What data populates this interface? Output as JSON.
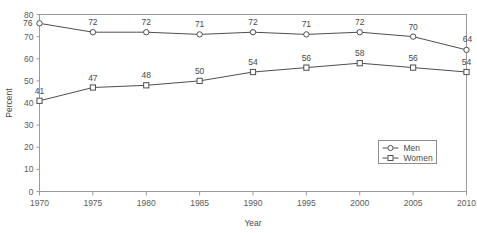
{
  "chart_data": {
    "type": "line",
    "title": "",
    "xlabel": "Year",
    "ylabel": "Percent",
    "categories": [
      1970,
      1975,
      1980,
      1985,
      1990,
      1995,
      2000,
      2005,
      2010
    ],
    "x_tick_labels": [
      "1970",
      "1975",
      "1980",
      "1985",
      "1990",
      "1995",
      "2000",
      "2005",
      "2010"
    ],
    "y_tick_labels": [
      "0",
      "10",
      "20",
      "30",
      "40",
      "50",
      "60",
      "70",
      "80"
    ],
    "y_ticks": [
      0,
      10,
      20,
      30,
      40,
      50,
      60,
      70,
      80
    ],
    "ylim": [
      0,
      80
    ],
    "xlim": [
      1970,
      2010
    ],
    "grid": false,
    "legend_position": "lower-right",
    "series": [
      {
        "name": "Men",
        "marker": "open-circle",
        "values": [
          76,
          72,
          72,
          71,
          72,
          71,
          72,
          70,
          64
        ],
        "labels": [
          "76",
          "72",
          "72",
          "71",
          "72",
          "71",
          "72",
          "70",
          "64"
        ]
      },
      {
        "name": "Women",
        "marker": "open-square",
        "values": [
          41,
          47,
          48,
          50,
          54,
          56,
          58,
          56,
          54
        ],
        "labels": [
          "41",
          "47",
          "48",
          "50",
          "54",
          "56",
          "58",
          "56",
          "54"
        ]
      }
    ],
    "colors": {
      "line": "#4f4f4f",
      "marker_fill": "#ffffff",
      "axis": "#9a9a9a",
      "text": "#4a4a4a",
      "background": "#ffffff"
    }
  },
  "legend": {
    "entries": [
      {
        "label": "Men"
      },
      {
        "label": "Women"
      }
    ]
  },
  "axes": {
    "x_title": "Year",
    "y_title": "Percent"
  }
}
